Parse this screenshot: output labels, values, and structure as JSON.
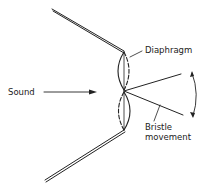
{
  "diagram": {
    "type": "schematic",
    "labels": {
      "sound": "Sound",
      "diaphragm": "Diaphragm",
      "bristle_line1": "Bristle",
      "bristle_line2": "movement"
    },
    "colors": {
      "stroke": "#222222",
      "background": "#ffffff"
    }
  }
}
